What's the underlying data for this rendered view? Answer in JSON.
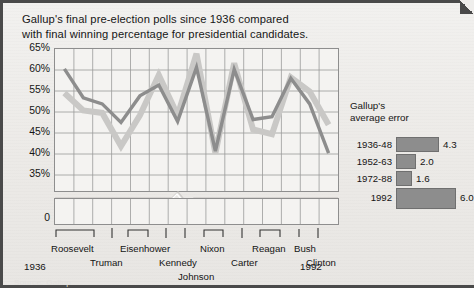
{
  "title": {
    "line1": "Gallup's final pre-election polls since 1936 compared",
    "line2": "with final winning percentage for presidential candidates."
  },
  "axis": {
    "y_ticks": [
      "65%",
      "60%",
      "55%",
      "50%",
      "45%",
      "40%",
      "35%"
    ],
    "zero_label": "0",
    "x_start_year": "1936",
    "x_end_year": "1992"
  },
  "presidents": [
    {
      "name": "Roosevelt",
      "row": 0
    },
    {
      "name": "Truman",
      "row": 1
    },
    {
      "name": "Eisenhower",
      "row": 0
    },
    {
      "name": "Kennedy",
      "row": 1
    },
    {
      "name": "Johnson",
      "row": 2
    },
    {
      "name": "Nixon",
      "row": 0
    },
    {
      "name": "Carter",
      "row": 1
    },
    {
      "name": "Reagan",
      "row": 0
    },
    {
      "name": "Bush",
      "row": 0
    },
    {
      "name": "Clinton",
      "row": 1
    }
  ],
  "error_panel": {
    "title_line1": "Gallup's",
    "title_line2": "average error",
    "rows": [
      {
        "period": "1936-48",
        "value": "4.3"
      },
      {
        "period": "1952-63",
        "value": "2.0"
      },
      {
        "period": "1972-88",
        "value": "1.6"
      },
      {
        "period": "1992",
        "value": "6.0"
      }
    ]
  },
  "colors": {
    "poll_line": "#c9c8c6",
    "result_line": "#8d8d8d",
    "bar_fill": "#8d8d8d",
    "grid": "#9a9a9a",
    "frame": "#4a4a4a",
    "plot_bg": "#f4f3f1"
  },
  "source_note": "Source: Gallup",
  "chart_data": {
    "type": "line",
    "title": "Gallup's final pre-election polls since 1936 compared with final winning percentage for presidential candidates.",
    "xlabel": "",
    "ylabel": "",
    "ylim": [
      35,
      65
    ],
    "y_axis_break": true,
    "grid": true,
    "legend": "none",
    "x": [
      "1936",
      "1940",
      "1944",
      "1948",
      "1952",
      "1956",
      "1960",
      "1964",
      "1968",
      "1972",
      "1976",
      "1980",
      "1984",
      "1988",
      "1992"
    ],
    "series": [
      {
        "name": "Gallup final poll",
        "color": "#c9c8c6",
        "values": [
          55.7,
          52.0,
          51.5,
          44.5,
          51.0,
          59.5,
          51.0,
          64.0,
          43.0,
          62.0,
          48.0,
          47.0,
          59.0,
          56.0,
          49.0
        ]
      },
      {
        "name": "Final winning percentage",
        "color": "#8d8d8d",
        "values": [
          60.8,
          54.7,
          53.4,
          49.5,
          55.1,
          57.4,
          49.7,
          61.1,
          43.4,
          60.7,
          50.1,
          50.7,
          58.8,
          53.4,
          43.0
        ]
      }
    ],
    "error_chart": {
      "type": "bar",
      "orientation": "horizontal",
      "title": "Gallup's average error",
      "categories": [
        "1936-48",
        "1952-63",
        "1972-88",
        "1992"
      ],
      "values": [
        4.3,
        2.0,
        1.6,
        6.0
      ],
      "color": "#8d8d8d"
    }
  }
}
